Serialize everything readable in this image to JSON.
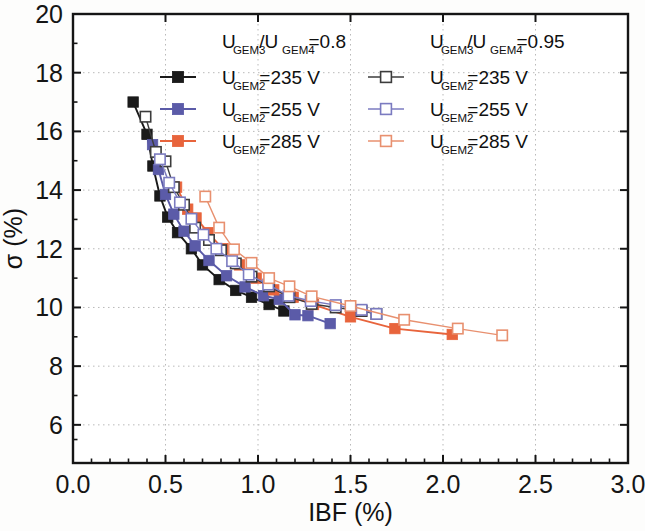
{
  "figure": {
    "background_color": "#fdfdfc",
    "frame_color": "#151515"
  },
  "axes": {
    "x": {
      "label": "IBF (%)",
      "min": 0.0,
      "max": 3.0,
      "ticks": [
        "0.0",
        "0.5",
        "1.0",
        "1.5",
        "2.0",
        "2.5",
        "3.0"
      ],
      "tick_values": [
        0.0,
        0.5,
        1.0,
        1.5,
        2.0,
        2.5,
        3.0
      ],
      "minor_per_major": 5
    },
    "y": {
      "label": "σ (%)",
      "min": 4.7,
      "max": 20.0,
      "ticks": [
        "20",
        "18",
        "16",
        "14",
        "12",
        "10",
        "8",
        "6"
      ],
      "tick_values": [
        20,
        18,
        16,
        14,
        12,
        10,
        8,
        6
      ],
      "minor_per_major": 2
    },
    "grid": "dotted"
  },
  "legend": {
    "columns": [
      {
        "heading_main": "U",
        "heading_sub1": "GEM3",
        "heading_mid": "/U",
        "heading_sub2": "GEM4",
        "heading_val": "=0.8",
        "entries": [
          {
            "prefix": "U",
            "sub": "GEM2",
            "value": "=235 V",
            "color": "#1a1a1a",
            "fill": "solid"
          },
          {
            "prefix": "U",
            "sub": "GEM2",
            "value": "=255 V",
            "color": "#5b5ba8",
            "fill": "solid"
          },
          {
            "prefix": "U",
            "sub": "GEM2",
            "value": "=285 V",
            "color": "#e8643c",
            "fill": "solid"
          }
        ]
      },
      {
        "heading_main": "U",
        "heading_sub1": "GEM3",
        "heading_mid": "/U",
        "heading_sub2": "GEM4",
        "heading_val": "=0.95",
        "entries": [
          {
            "prefix": "U",
            "sub": "GEM2",
            "value": "=235 V",
            "color": "#3c3c3c",
            "fill": "open"
          },
          {
            "prefix": "U",
            "sub": "GEM2",
            "value": "=255 V",
            "color": "#7b7bc0",
            "fill": "open"
          },
          {
            "prefix": "U",
            "sub": "GEM2",
            "value": "=285 V",
            "color": "#e8906f",
            "fill": "open"
          }
        ]
      }
    ]
  },
  "chart_data": {
    "type": "scatter",
    "title": "",
    "xlabel": "IBF (%)",
    "ylabel": "σ (%)",
    "xlim": [
      0.0,
      3.0
    ],
    "ylim": [
      4.7,
      20.0
    ],
    "grid": true,
    "legend_position": "top-center",
    "series": [
      {
        "name": "U_GEM3/U_GEM4=0.8, U_GEM2=235 V",
        "color": "#1a1a1a",
        "marker": "filled-square",
        "points": [
          [
            0.325,
            17.0
          ],
          [
            0.4,
            15.9
          ],
          [
            0.432,
            14.82
          ],
          [
            0.47,
            13.8
          ],
          [
            0.512,
            13.08
          ],
          [
            0.565,
            12.55
          ],
          [
            0.64,
            12.0
          ],
          [
            0.7,
            11.45
          ],
          [
            0.79,
            10.95
          ],
          [
            0.88,
            10.58
          ],
          [
            0.965,
            10.35
          ],
          [
            1.06,
            10.1
          ],
          [
            1.14,
            9.88
          ]
        ]
      },
      {
        "name": "U_GEM3/U_GEM4=0.8, U_GEM2=255 V",
        "color": "#5b5ba8",
        "marker": "filled-square",
        "points": [
          [
            0.43,
            15.55
          ],
          [
            0.462,
            14.7
          ],
          [
            0.5,
            13.85
          ],
          [
            0.545,
            13.18
          ],
          [
            0.6,
            12.6
          ],
          [
            0.66,
            12.1
          ],
          [
            0.735,
            11.6
          ],
          [
            0.83,
            11.08
          ],
          [
            0.93,
            10.7
          ],
          [
            1.03,
            10.4
          ],
          [
            1.115,
            10.28
          ],
          [
            1.2,
            9.75
          ],
          [
            1.27,
            9.72
          ],
          [
            1.39,
            9.45
          ]
        ]
      },
      {
        "name": "U_GEM3/U_GEM4=0.8, U_GEM2=285 V",
        "color": "#e8643c",
        "marker": "filled-square",
        "points": [
          [
            0.56,
            14.1
          ],
          [
            0.62,
            13.35
          ],
          [
            0.665,
            13.05
          ],
          [
            0.73,
            12.55
          ],
          [
            0.81,
            12.0
          ],
          [
            0.9,
            11.45
          ],
          [
            0.99,
            11.0
          ],
          [
            1.085,
            10.6
          ],
          [
            1.19,
            10.35
          ],
          [
            1.3,
            10.1
          ],
          [
            1.5,
            9.68
          ],
          [
            1.74,
            9.28
          ],
          [
            2.05,
            9.08
          ]
        ]
      },
      {
        "name": "U_GEM3/U_GEM4=0.95, U_GEM2=235 V",
        "color": "#3c3c3c",
        "marker": "open-square",
        "points": [
          [
            0.392,
            16.5
          ],
          [
            0.448,
            15.3
          ],
          [
            0.5,
            14.98
          ],
          [
            0.545,
            14.1
          ],
          [
            0.6,
            13.5
          ],
          [
            0.66,
            12.72
          ],
          [
            0.735,
            12.3
          ],
          [
            0.8,
            11.95
          ],
          [
            0.88,
            11.5
          ],
          [
            0.965,
            11.05
          ],
          [
            1.06,
            10.72
          ],
          [
            1.17,
            10.35
          ],
          [
            1.29,
            10.12
          ],
          [
            1.42,
            10.0
          ],
          [
            1.56,
            9.88
          ],
          [
            1.64,
            9.78
          ]
        ]
      },
      {
        "name": "U_GEM3/U_GEM4=0.95, U_GEM2=255 V",
        "color": "#7b7bc0",
        "marker": "open-square",
        "points": [
          [
            0.47,
            15.05
          ],
          [
            0.52,
            14.25
          ],
          [
            0.578,
            13.58
          ],
          [
            0.64,
            13.02
          ],
          [
            0.705,
            12.48
          ],
          [
            0.775,
            12.0
          ],
          [
            0.86,
            11.58
          ],
          [
            0.95,
            11.12
          ],
          [
            1.055,
            10.78
          ],
          [
            1.165,
            10.4
          ],
          [
            1.285,
            10.22
          ],
          [
            1.42,
            10.08
          ],
          [
            1.56,
            9.92
          ],
          [
            1.64,
            9.78
          ]
        ]
      },
      {
        "name": "U_GEM3/U_GEM4=0.95, U_GEM2=285 V",
        "color": "#e8906f",
        "marker": "open-square",
        "points": [
          [
            0.715,
            13.78
          ],
          [
            0.79,
            12.72
          ],
          [
            0.87,
            11.98
          ],
          [
            0.965,
            11.52
          ],
          [
            1.06,
            11.0
          ],
          [
            1.17,
            10.72
          ],
          [
            1.29,
            10.38
          ],
          [
            1.5,
            10.05
          ],
          [
            1.79,
            9.58
          ],
          [
            2.08,
            9.28
          ],
          [
            2.32,
            9.05
          ]
        ]
      }
    ]
  }
}
